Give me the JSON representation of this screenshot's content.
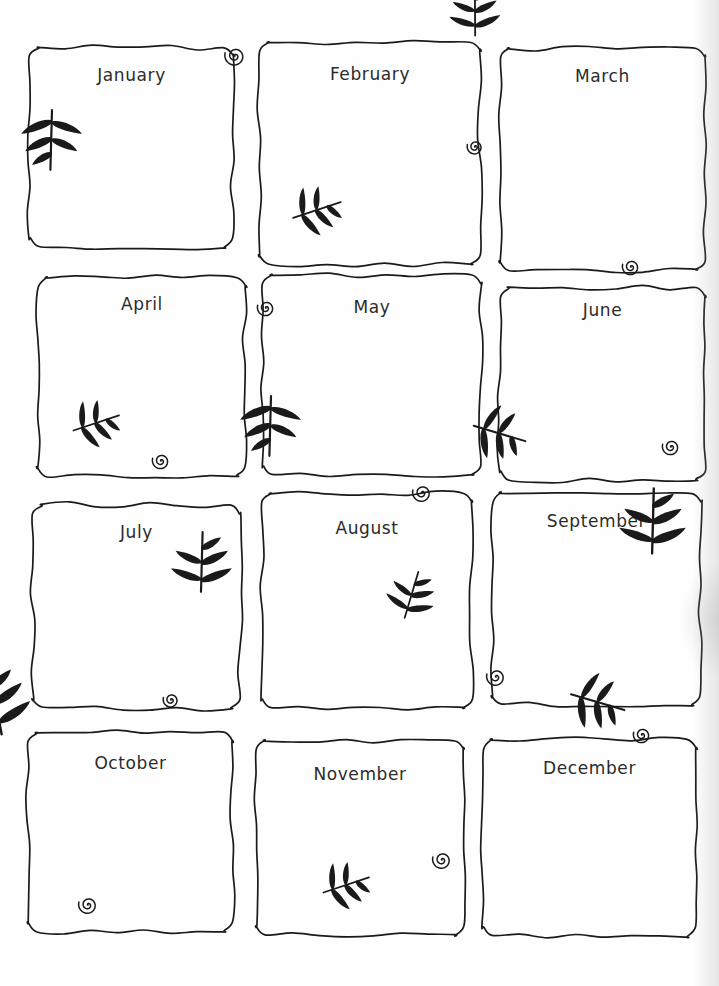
{
  "document": {
    "type": "hand-drawn-monthly-planner",
    "title_visible": false,
    "page_background": "#ffffff",
    "ink_color": "#1a1a1a",
    "label_color": "#2b2b2b",
    "grid": {
      "columns": 3,
      "rows": 4,
      "total_cells": 12
    }
  },
  "months": [
    {
      "label": "January",
      "x": 30,
      "y": 47,
      "w": 203,
      "h": 200,
      "label_top": 18,
      "decorations": [
        {
          "kind": "spiral",
          "name": "spiral-curl-top-right",
          "x": 192,
          "y": -4,
          "size": 26,
          "rotate": 0
        },
        {
          "kind": "leaf",
          "name": "leaf-sprig-left-edge",
          "x": 2,
          "y": 62,
          "size": 62,
          "rotate": 0
        }
      ]
    },
    {
      "label": "February",
      "x": 260,
      "y": 42,
      "w": 220,
      "h": 222,
      "label_top": 22,
      "decorations": [
        {
          "kind": "spiral",
          "name": "spiral-curl-right-edge",
          "x": 205,
          "y": 95,
          "size": 20,
          "rotate": 0
        },
        {
          "kind": "leaf",
          "name": "leaf-sprig-bottom-left",
          "x": 38,
          "y": 192,
          "size": 52,
          "rotate": 250
        }
      ]
    },
    {
      "label": "March",
      "x": 500,
      "y": 48,
      "w": 205,
      "h": 222,
      "label_top": 18,
      "decorations": [
        {
          "kind": "leaf",
          "name": "leaf-sprig-top-left",
          "x": -8,
          "y": -12,
          "size": 52,
          "rotate": 178
        },
        {
          "kind": "spiral",
          "name": "spiral-curl-bottom-center",
          "x": 120,
          "y": 208,
          "size": 22,
          "rotate": 0
        }
      ]
    },
    {
      "label": "April",
      "x": 38,
      "y": 278,
      "w": 208,
      "h": 198,
      "label_top": 16,
      "decorations": [
        {
          "kind": "leaf",
          "name": "leaf-sprig-bottom-left",
          "x": 40,
          "y": 168,
          "size": 50,
          "rotate": 250
        },
        {
          "kind": "spiral",
          "name": "spiral-curl-bottom-center",
          "x": 112,
          "y": 172,
          "size": 22,
          "rotate": 0
        }
      ]
    },
    {
      "label": "May",
      "x": 263,
      "y": 275,
      "w": 218,
      "h": 200,
      "label_top": 22,
      "decorations": [
        {
          "kind": "spiral",
          "name": "spiral-curl-top-left",
          "x": -8,
          "y": 22,
          "size": 22,
          "rotate": 0
        },
        {
          "kind": "leaf",
          "name": "leaf-sprig-bottom-left-edge",
          "x": -12,
          "y": 120,
          "size": 62,
          "rotate": 0
        }
      ]
    },
    {
      "label": "June",
      "x": 500,
      "y": 288,
      "w": 205,
      "h": 192,
      "label_top": 12,
      "decorations": [
        {
          "kind": "leaf",
          "name": "leaf-sprig-bottom-left-pointing-left",
          "x": -32,
          "y": 155,
          "size": 56,
          "rotate": 285
        },
        {
          "kind": "spiral",
          "name": "spiral-curl-bottom-right",
          "x": 160,
          "y": 148,
          "size": 22,
          "rotate": 0
        }
      ]
    },
    {
      "label": "July",
      "x": 33,
      "y": 505,
      "w": 207,
      "h": 203,
      "label_top": 17,
      "decorations": [
        {
          "kind": "leaf",
          "name": "leaf-sprig-right-edge",
          "x": 188,
          "y": 88,
          "size": 62,
          "rotate": 180
        },
        {
          "kind": "spiral",
          "name": "spiral-curl-bottom-center",
          "x": 128,
          "y": 185,
          "size": 20,
          "rotate": 0
        }
      ]
    },
    {
      "label": "August",
      "x": 262,
      "y": 493,
      "w": 210,
      "h": 215,
      "label_top": 25,
      "decorations": [
        {
          "kind": "spiral",
          "name": "spiral-curl-top-right",
          "x": 148,
          "y": -12,
          "size": 24,
          "rotate": 0
        },
        {
          "kind": "leaf",
          "name": "leaf-sprig-bottom-right",
          "x": 158,
          "y": 130,
          "size": 50,
          "rotate": 195
        }
      ]
    },
    {
      "label": "September",
      "x": 492,
      "y": 493,
      "w": 209,
      "h": 212,
      "label_top": 18,
      "decorations": [
        {
          "kind": "leaf",
          "name": "leaf-sprig-right-edge-overflow",
          "x": 182,
          "y": 62,
          "size": 68,
          "rotate": 180
        },
        {
          "kind": "spiral",
          "name": "spiral-curl-bottom-left",
          "x": -8,
          "y": 172,
          "size": 24,
          "rotate": 0
        }
      ]
    },
    {
      "label": "October",
      "x": 28,
      "y": 733,
      "w": 205,
      "h": 198,
      "label_top": 20,
      "decorations": [
        {
          "kind": "leaf",
          "name": "leaf-sprig-top-left-edge",
          "x": -4,
          "y": -2,
          "size": 70,
          "rotate": 168
        },
        {
          "kind": "spiral",
          "name": "spiral-curl-bottom-left",
          "x": 48,
          "y": 160,
          "size": 24,
          "rotate": 0
        }
      ]
    },
    {
      "label": "November",
      "x": 256,
      "y": 740,
      "w": 208,
      "h": 195,
      "label_top": 24,
      "decorations": [
        {
          "kind": "spiral",
          "name": "spiral-curl-right-edge",
          "x": 174,
          "y": 108,
          "size": 24,
          "rotate": 0
        },
        {
          "kind": "leaf",
          "name": "leaf-sprig-bottom-center",
          "x": 72,
          "y": 168,
          "size": 50,
          "rotate": 250
        }
      ]
    },
    {
      "label": "December",
      "x": 483,
      "y": 740,
      "w": 213,
      "h": 196,
      "label_top": 18,
      "decorations": [
        {
          "kind": "leaf",
          "name": "leaf-sprig-top-center-pointing-left",
          "x": 82,
          "y": -28,
          "size": 58,
          "rotate": 285
        },
        {
          "kind": "spiral",
          "name": "spiral-curl-top-right",
          "x": 148,
          "y": -16,
          "size": 22,
          "rotate": 0
        }
      ]
    }
  ]
}
